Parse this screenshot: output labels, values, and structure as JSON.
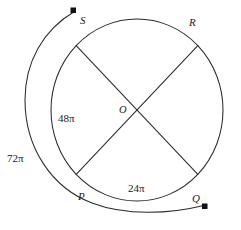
{
  "figure": {
    "background_color": "#ffffff",
    "stroke_color": "#2b2b2b",
    "marker_color": "#111111"
  },
  "circle": {
    "center_label": "O",
    "center_x": 137,
    "center_y": 110,
    "radius_x": 86,
    "radius_y": 91
  },
  "vertices": [
    {
      "label": "S",
      "position": "top-left",
      "angle_deg": 135
    },
    {
      "label": "R",
      "position": "top-right",
      "angle_deg": 45
    },
    {
      "label": "P",
      "position": "bottom-left",
      "angle_deg": 225
    },
    {
      "label": "Q",
      "position": "bottom-right",
      "angle_deg": 315
    }
  ],
  "chords": [
    {
      "name": "diameter-S-Q",
      "from": "S",
      "to": "Q"
    },
    {
      "name": "diameter-R-P",
      "from": "R",
      "to": "P"
    }
  ],
  "arc_measures": [
    {
      "name": "arc-SP-measure",
      "value": "48",
      "symbol": "π",
      "text": "48π",
      "location": "inside-left-arc"
    },
    {
      "name": "arc-PQ-measure",
      "value": "24",
      "symbol": "π",
      "text": "24π",
      "location": "inside-bottom-arc"
    },
    {
      "name": "outer-arc-measure",
      "value": "72",
      "symbol": "π",
      "text": "72π",
      "location": "outside-left"
    }
  ],
  "outer_arc": {
    "name": "outer-measuring-arc",
    "measure_text": "72π",
    "start_marker": "square",
    "end_marker": "square",
    "start_near_vertex": "S",
    "end_near_vertex": "Q",
    "direction": "counterclockwise"
  }
}
